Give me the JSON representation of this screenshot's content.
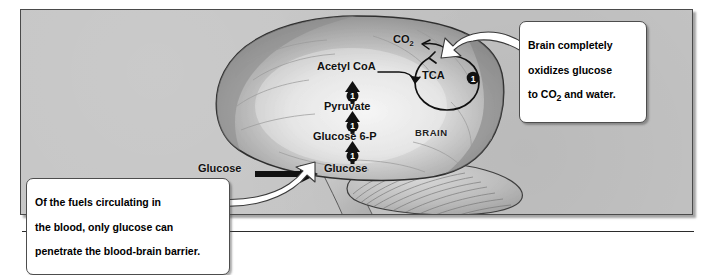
{
  "figure": {
    "panel_bg": "#c4c4c4",
    "border_color": "#4a4a4a",
    "brain_label": "BRAIN"
  },
  "pathway": {
    "external_substrate": "Glucose",
    "steps": [
      {
        "name": "Glucose",
        "badge": "1"
      },
      {
        "name": "Glucose 6-P",
        "badge": "1"
      },
      {
        "name": "Pyruvate",
        "badge": "1"
      },
      {
        "name": "Acetyl CoA",
        "badge": ""
      }
    ],
    "cycle": {
      "label": "TCA",
      "badge": "1"
    },
    "product": "CO2",
    "product_main": "CO",
    "product_sub": "2"
  },
  "callouts": [
    {
      "id": "oxidation",
      "text": "Brain completely\noxidizes glucose\nto CO2 and water.",
      "line1": "Brain completely",
      "line2": "oxidizes glucose",
      "line3_a": "to CO",
      "line3_sub": "2",
      "line3_b": " and water."
    },
    {
      "id": "bbb",
      "text": "Of the fuels circulating in\nthe blood, only glucose can\npenetrate the blood-brain barrier.",
      "line1": "Of the fuels circulating in",
      "line2": "the blood, only glucose can",
      "line3": "penetrate the blood-brain barrier."
    }
  ]
}
